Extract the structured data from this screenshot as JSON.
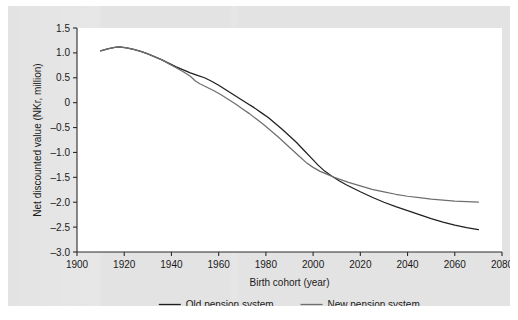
{
  "figure": {
    "background_color": "#e3e3e3",
    "plot_background_color": "#ffffff",
    "axis_color": "#2b2b2b"
  },
  "chart_data": {
    "type": "line",
    "title": "",
    "subtitle": "",
    "xlabel": "Birth cohort (year)",
    "ylabel": "Net discounted value (NKr, million)",
    "xlim": [
      1900,
      2080
    ],
    "ylim": [
      -3.0,
      1.5
    ],
    "xticks": [
      1900,
      1920,
      1940,
      1960,
      1980,
      2000,
      2020,
      2040,
      2060,
      2080
    ],
    "xtick_labels": [
      "1900",
      "1920",
      "1940",
      "1960",
      "1980",
      "2000",
      "2020",
      "2040",
      "2060",
      "2080"
    ],
    "yticks": [
      1.5,
      1.0,
      0.5,
      0,
      -0.5,
      -1.0,
      -1.5,
      -2.0,
      -2.5,
      -3.0
    ],
    "ytick_labels": [
      "1.5",
      "1.0",
      "0.5",
      "0",
      "-0.5",
      "-1.0",
      "-1.5",
      "-2.0",
      "-2.5",
      "-3.0"
    ],
    "grid": false,
    "legend_position": "below",
    "series": [
      {
        "name": "Old pension system",
        "color": "#1f1f1f",
        "x": [
          1910,
          1913,
          1916,
          1918,
          1921,
          1924,
          1927,
          1930,
          1933,
          1936,
          1939,
          1942,
          1945,
          1948,
          1951,
          1954,
          1957,
          1960,
          1963,
          1966,
          1969,
          1972,
          1975,
          1978,
          1981,
          1984,
          1987,
          1990,
          1993,
          1996,
          1999,
          2002,
          2005,
          2008,
          2011,
          2014,
          2017,
          2020,
          2025,
          2030,
          2035,
          2040,
          2045,
          2050,
          2055,
          2060,
          2065,
          2070
        ],
        "y": [
          1.04,
          1.08,
          1.11,
          1.12,
          1.1,
          1.07,
          1.03,
          0.98,
          0.92,
          0.86,
          0.79,
          0.72,
          0.66,
          0.6,
          0.55,
          0.5,
          0.43,
          0.35,
          0.26,
          0.17,
          0.08,
          -0.01,
          -0.1,
          -0.2,
          -0.3,
          -0.42,
          -0.54,
          -0.67,
          -0.8,
          -0.95,
          -1.1,
          -1.25,
          -1.38,
          -1.48,
          -1.57,
          -1.65,
          -1.72,
          -1.79,
          -1.9,
          -2.0,
          -2.09,
          -2.17,
          -2.25,
          -2.33,
          -2.4,
          -2.46,
          -2.51,
          -2.55
        ]
      },
      {
        "name": "New pension system",
        "color": "#6e6e6e",
        "x": [
          1910,
          1913,
          1916,
          1918,
          1921,
          1924,
          1927,
          1930,
          1933,
          1936,
          1939,
          1942,
          1945,
          1948,
          1950,
          1952,
          1955,
          1958,
          1961,
          1964,
          1967,
          1970,
          1973,
          1976,
          1979,
          1982,
          1985,
          1988,
          1991,
          1994,
          1997,
          2000,
          2003,
          2006,
          2009,
          2012,
          2015,
          2020,
          2025,
          2030,
          2035,
          2040,
          2045,
          2050,
          2055,
          2060,
          2065,
          2070
        ],
        "y": [
          1.04,
          1.08,
          1.11,
          1.12,
          1.1,
          1.07,
          1.03,
          0.98,
          0.92,
          0.86,
          0.78,
          0.7,
          0.62,
          0.53,
          0.44,
          0.38,
          0.31,
          0.24,
          0.16,
          0.07,
          -0.02,
          -0.12,
          -0.22,
          -0.33,
          -0.44,
          -0.56,
          -0.68,
          -0.81,
          -0.94,
          -1.07,
          -1.2,
          -1.3,
          -1.38,
          -1.44,
          -1.5,
          -1.55,
          -1.6,
          -1.67,
          -1.74,
          -1.79,
          -1.84,
          -1.88,
          -1.91,
          -1.94,
          -1.96,
          -1.98,
          -1.99,
          -2.0
        ]
      }
    ]
  },
  "legend": {
    "items": [
      {
        "label": "Old pension system",
        "color": "#1f1f1f"
      },
      {
        "label": "New pension system",
        "color": "#6e6e6e"
      }
    ]
  }
}
